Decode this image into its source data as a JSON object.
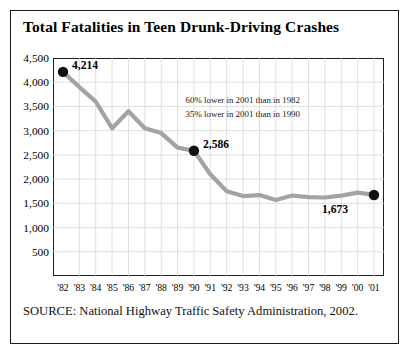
{
  "figure": {
    "title": "Total Fatalities in Teen Drunk-Driving Crashes",
    "source": "SOURCE: National Highway Traffic Safety Administration, 2002.",
    "frame_color": "#1a1a1a",
    "background": "#ffffff"
  },
  "annotations": {
    "line1": "60% lower in 2001 than in 1982",
    "line2": "35% lower in 2001 than in 1990"
  },
  "chart_data": {
    "type": "line",
    "title": "Total Fatalities in Teen Drunk-Driving Crashes",
    "xlabel": "",
    "ylabel": "",
    "ylim": [
      0,
      4500
    ],
    "yticks": [
      500,
      1000,
      1500,
      2000,
      2500,
      3000,
      3500,
      4000,
      4500
    ],
    "ytick_labels": [
      "500",
      "1,000",
      "1,500",
      "2,000",
      "2,500",
      "3,000",
      "3,500",
      "4,000",
      "4,500"
    ],
    "grid": true,
    "legend": false,
    "line_color": "#a3a3a3",
    "marker_color": "#111111",
    "categories": [
      "'82",
      "'83",
      "'84",
      "'85",
      "'86",
      "'87",
      "'88",
      "'89",
      "'90",
      "'91",
      "'92",
      "'93",
      "'94",
      "'95",
      "'96",
      "'97",
      "'98",
      "'99",
      "'00",
      "'01"
    ],
    "x_full_years": [
      1982,
      1983,
      1984,
      1985,
      1986,
      1987,
      1988,
      1989,
      1990,
      1991,
      1992,
      1993,
      1994,
      1995,
      1996,
      1997,
      1998,
      1999,
      2000,
      2001
    ],
    "values": [
      4214,
      3900,
      3600,
      3050,
      3400,
      3050,
      2950,
      2650,
      2586,
      2100,
      1750,
      1650,
      1670,
      1570,
      1660,
      1630,
      1620,
      1660,
      1720,
      1673
    ],
    "data_labels": [
      {
        "index": 0,
        "year": "'82",
        "value": 4214,
        "text": "4,214"
      },
      {
        "index": 8,
        "year": "'90",
        "value": 2586,
        "text": "2,586"
      },
      {
        "index": 19,
        "year": "'01",
        "value": 1673,
        "text": "1,673"
      }
    ],
    "annotations": [
      "60% lower in 2001 than in 1982",
      "35% lower in 2001 than in 1990"
    ]
  }
}
